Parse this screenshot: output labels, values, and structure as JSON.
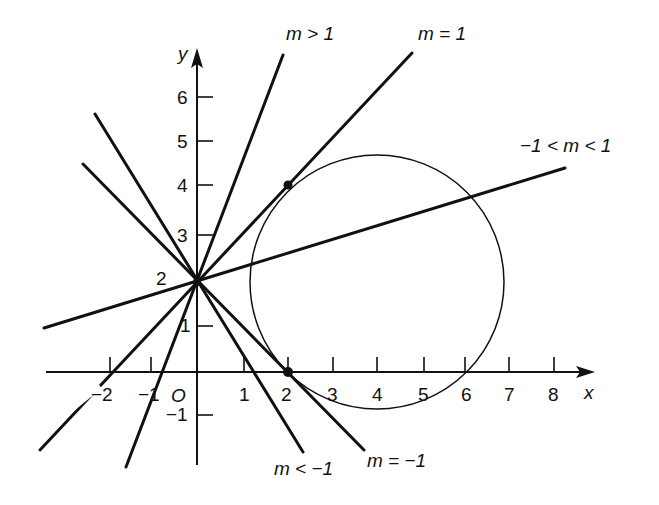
{
  "figure": {
    "axes": {
      "x_label": "x",
      "y_label": "y",
      "origin_label": "O",
      "x_ticks": [
        "−2",
        "−1",
        "1",
        "2",
        "3",
        "4",
        "5",
        "6",
        "7",
        "8"
      ],
      "y_ticks": [
        "−1",
        "1",
        "2",
        "3",
        "4",
        "5",
        "6"
      ]
    },
    "line_labels": {
      "steep_positive": "m > 1",
      "unit_positive": "m = 1",
      "shallow": "−1 < m < 1",
      "steep_negative": "m < −1",
      "unit_negative": "m = −1"
    },
    "points": [
      {
        "name": "tangent-point-upper",
        "coords": [
          2,
          4
        ]
      },
      {
        "name": "tangent-point-lower",
        "coords": [
          2,
          0
        ]
      },
      {
        "name": "common-point",
        "coords": [
          0,
          2
        ]
      }
    ],
    "circle": {
      "center": [
        4,
        2
      ],
      "radius": 2.83
    },
    "colors": {
      "ink": "#111111",
      "background": "#ffffff"
    }
  }
}
